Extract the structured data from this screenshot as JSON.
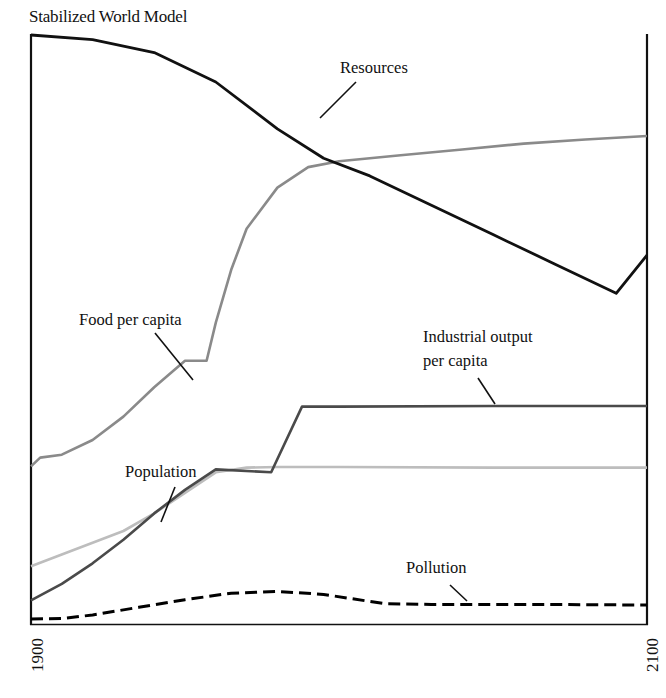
{
  "chart_data": {
    "type": "line",
    "title": "Stabilized World Model",
    "xlabel": "",
    "ylabel": "",
    "x_ticks": [
      "1900",
      "2100"
    ],
    "xlim": [
      1900,
      2100
    ],
    "ylim": [
      0,
      100
    ],
    "grid": false,
    "legend": "inline labels with leader lines",
    "series": [
      {
        "name": "Resources",
        "color": "#111111",
        "style": "solid",
        "points": [
          [
            1900,
            100
          ],
          [
            1920,
            99.2
          ],
          [
            1940,
            97
          ],
          [
            1960,
            92
          ],
          [
            1980,
            84
          ],
          [
            1995,
            79
          ],
          [
            2010,
            76
          ],
          [
            2030,
            71
          ],
          [
            2050,
            66
          ],
          [
            2070,
            61
          ],
          [
            2090,
            56
          ],
          [
            2100,
            62.5
          ]
        ]
      },
      {
        "name": "Food per capita",
        "color": "#8a8a8a",
        "style": "solid",
        "points": [
          [
            1900,
            26.5
          ],
          [
            1903,
            28
          ],
          [
            1910,
            28.5
          ],
          [
            1920,
            31
          ],
          [
            1930,
            35
          ],
          [
            1940,
            40
          ],
          [
            1950,
            44.5
          ],
          [
            1957,
            44.5
          ],
          [
            1960,
            51
          ],
          [
            1965,
            60
          ],
          [
            1970,
            67
          ],
          [
            1980,
            74
          ],
          [
            1990,
            77.5
          ],
          [
            2000,
            78.5
          ],
          [
            2020,
            79.5
          ],
          [
            2040,
            80.5
          ],
          [
            2060,
            81.5
          ],
          [
            2080,
            82.2
          ],
          [
            2100,
            82.8
          ]
        ]
      },
      {
        "name": "Industrial output per capita",
        "color": "#4a4a4a",
        "style": "solid",
        "points": [
          [
            1900,
            3.7
          ],
          [
            1910,
            6.5
          ],
          [
            1920,
            10
          ],
          [
            1930,
            14
          ],
          [
            1940,
            18.5
          ],
          [
            1950,
            22.5
          ],
          [
            1960,
            26
          ],
          [
            1978,
            25.5
          ],
          [
            1988,
            36.7
          ],
          [
            2000,
            36.7
          ],
          [
            2050,
            36.8
          ],
          [
            2100,
            36.8
          ]
        ]
      },
      {
        "name": "Population",
        "color": "#bdbdbd",
        "style": "solid",
        "points": [
          [
            1900,
            9.5
          ],
          [
            1910,
            11.5
          ],
          [
            1920,
            13.5
          ],
          [
            1930,
            15.5
          ],
          [
            1940,
            18.5
          ],
          [
            1950,
            22
          ],
          [
            1960,
            25.5
          ],
          [
            1970,
            26.3
          ],
          [
            1980,
            26.4
          ],
          [
            2000,
            26.4
          ],
          [
            2050,
            26.3
          ],
          [
            2100,
            26.3
          ]
        ]
      },
      {
        "name": "Pollution",
        "color": "#000000",
        "style": "dashed",
        "points": [
          [
            1900,
            0.5
          ],
          [
            1910,
            0.6
          ],
          [
            1920,
            1.2
          ],
          [
            1935,
            2.5
          ],
          [
            1950,
            3.8
          ],
          [
            1965,
            4.9
          ],
          [
            1980,
            5.2
          ],
          [
            1995,
            4.7
          ],
          [
            2015,
            3.1
          ],
          [
            2030,
            3.0
          ],
          [
            2060,
            3.0
          ],
          [
            2100,
            2.9
          ]
        ]
      }
    ]
  },
  "labels": {
    "title": "Stabilized World Model",
    "resources": "Resources",
    "food": "Food per capita",
    "industrial_line1": "Industrial output",
    "industrial_line2": "per capita",
    "population": "Population",
    "pollution": "Pollution",
    "x_start": "1900",
    "x_end": "2100"
  }
}
